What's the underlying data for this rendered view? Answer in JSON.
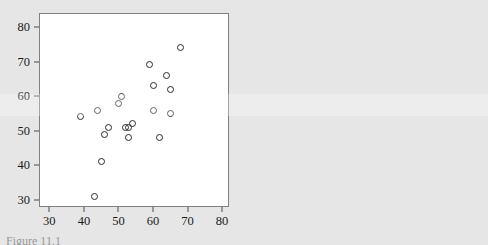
{
  "figure": {
    "background_color": "#e6e6e6",
    "panel_background_color": "#ffffff",
    "marker_color": "#2b2b2b",
    "axis_color": "#808080",
    "caption_clipped": "Figure 11.1"
  },
  "chart_data": [
    {
      "type": "scatter",
      "title": "",
      "subtitle": "",
      "xlabel": "",
      "ylabel": "",
      "xlim": [
        27,
        82
      ],
      "ylim": [
        28,
        84
      ],
      "xticks": [
        30,
        40,
        50,
        60,
        70,
        80
      ],
      "yticks": [
        30,
        40,
        50,
        60,
        70,
        80
      ],
      "xticklabels": [
        "30",
        "40",
        "50",
        "60",
        "70",
        "80"
      ],
      "yticklabels": [
        "30",
        "40",
        "50",
        "60",
        "70",
        "80"
      ],
      "grid": false,
      "legend": null,
      "marker": "open-circle",
      "points": [
        {
          "x": 39,
          "y": 54
        },
        {
          "x": 43,
          "y": 31
        },
        {
          "x": 44,
          "y": 56
        },
        {
          "x": 45,
          "y": 41
        },
        {
          "x": 46,
          "y": 49
        },
        {
          "x": 47,
          "y": 51
        },
        {
          "x": 50,
          "y": 58
        },
        {
          "x": 51,
          "y": 60
        },
        {
          "x": 52,
          "y": 51
        },
        {
          "x": 53,
          "y": 48
        },
        {
          "x": 53,
          "y": 51
        },
        {
          "x": 54,
          "y": 52
        },
        {
          "x": 59,
          "y": 69
        },
        {
          "x": 60,
          "y": 63
        },
        {
          "x": 60,
          "y": 56
        },
        {
          "x": 62,
          "y": 48
        },
        {
          "x": 64,
          "y": 66
        },
        {
          "x": 65,
          "y": 62
        },
        {
          "x": 65,
          "y": 55
        },
        {
          "x": 68,
          "y": 74
        }
      ]
    },
    {
      "type": "scatter",
      "title": "",
      "subtitle": "",
      "xlabel": "",
      "ylabel": "",
      "xlim": [
        -6,
        126
      ],
      "ylim": [
        -7,
        128
      ],
      "xticks": [
        0,
        20,
        40,
        60,
        80,
        100,
        120
      ],
      "yticks": [
        0,
        20,
        40,
        60,
        80,
        100,
        120
      ],
      "xticklabels": [
        "0",
        "20",
        "40",
        "60",
        "80",
        "100",
        "120"
      ],
      "yticklabels": [
        "0",
        "20",
        "40",
        "60",
        "80",
        "100",
        "120"
      ],
      "grid": false,
      "legend": null,
      "marker": "open-circle",
      "points": [
        {
          "x": 39,
          "y": 54
        },
        {
          "x": 43,
          "y": 31
        },
        {
          "x": 44,
          "y": 56
        },
        {
          "x": 45,
          "y": 41
        },
        {
          "x": 46,
          "y": 49
        },
        {
          "x": 47,
          "y": 51
        },
        {
          "x": 50,
          "y": 58
        },
        {
          "x": 51,
          "y": 60
        },
        {
          "x": 52,
          "y": 51
        },
        {
          "x": 53,
          "y": 48
        },
        {
          "x": 53,
          "y": 51
        },
        {
          "x": 54,
          "y": 52
        },
        {
          "x": 59,
          "y": 69
        },
        {
          "x": 60,
          "y": 63
        },
        {
          "x": 60,
          "y": 56
        },
        {
          "x": 62,
          "y": 48
        },
        {
          "x": 64,
          "y": 66
        },
        {
          "x": 65,
          "y": 62
        },
        {
          "x": 65,
          "y": 55
        },
        {
          "x": 68,
          "y": 74
        }
      ]
    }
  ]
}
